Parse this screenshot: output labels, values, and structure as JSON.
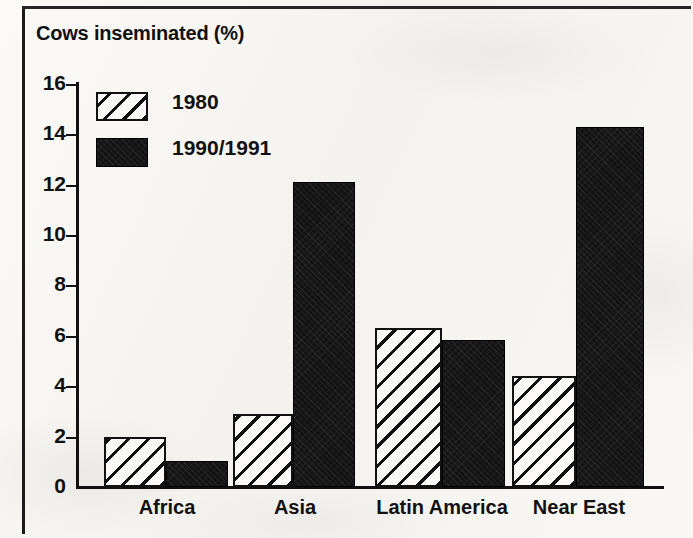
{
  "chart_data": {
    "type": "bar",
    "title": "Cows inseminated (%)",
    "xlabel": "",
    "ylabel": "",
    "ylim": [
      0,
      16
    ],
    "ytick_step": 2,
    "yticks": [
      16,
      14,
      12,
      10,
      8,
      6,
      4,
      2,
      0
    ],
    "grid": false,
    "legend_position": "upper-left-inside",
    "categories": [
      "Africa",
      "Asia",
      "Latin America",
      "Near East"
    ],
    "series": [
      {
        "name": "1980",
        "style": "hatched",
        "values": [
          2.0,
          2.9,
          6.3,
          4.4
        ]
      },
      {
        "name": "1990/1991",
        "style": "solid-black",
        "values": [
          1.05,
          12.1,
          5.85,
          14.3
        ]
      }
    ]
  },
  "figure": {
    "title": "Cows inseminated (%)",
    "axis": {
      "y_tick_labels": [
        "16",
        "14",
        "12",
        "10",
        "8",
        "6",
        "4",
        "2",
        "0"
      ],
      "category_labels": [
        "Africa",
        "Asia",
        "Latin America",
        "Near East"
      ]
    },
    "legend": {
      "entries": [
        {
          "label": "1980",
          "swatch": "hatched-swatch"
        },
        {
          "label": "1990/1991",
          "swatch": "solid-black-swatch"
        }
      ]
    },
    "colors": {
      "ink": "#111111",
      "paper": "#f7f6f3",
      "series_1980_fill": "#fbfaf8",
      "series_1990_fill": "#141414"
    }
  }
}
